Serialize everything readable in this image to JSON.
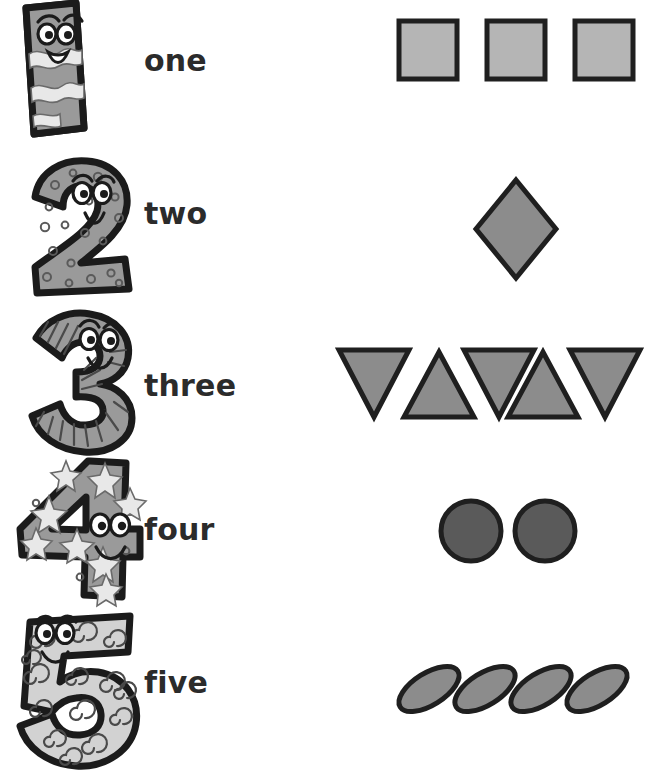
{
  "page": {
    "kind": "counting-worksheet",
    "background_color": "#ffffff",
    "width": 652,
    "height": 781
  },
  "palette": {
    "ink": "#1b1b1b",
    "text": "#2b2b2b",
    "shape_light": "#b5b5b5",
    "shape_medium": "#8c8c8c",
    "shape_dark": "#5a5a5a",
    "numeral_fill_medium": "#9a9a9a",
    "numeral_fill_light": "#d2d2d2",
    "decoration_light": "#e8e8e8"
  },
  "rows": [
    {
      "digit": "1",
      "word": "one",
      "numeral_pattern": "wavy-stripes",
      "numeral_fill": "#9a9a9a",
      "shape_name": "square",
      "shape_count": 3,
      "shape_fill": "#b5b5b5"
    },
    {
      "digit": "2",
      "word": "two",
      "numeral_pattern": "dots",
      "numeral_fill": "#9a9a9a",
      "shape_name": "diamond",
      "shape_count": 1,
      "shape_fill": "#8c8c8c"
    },
    {
      "digit": "3",
      "word": "three",
      "numeral_pattern": "radiating-stripes",
      "numeral_fill": "#9a9a9a",
      "shape_name": "triangle",
      "shape_count": 5,
      "shape_fill": "#8c8c8c"
    },
    {
      "digit": "4",
      "word": "four",
      "numeral_pattern": "stars",
      "numeral_fill": "#9a9a9a",
      "shape_name": "circle",
      "shape_count": 2,
      "shape_fill": "#5a5a5a"
    },
    {
      "digit": "5",
      "word": "five",
      "numeral_pattern": "spirals",
      "numeral_fill": "#d2d2d2",
      "shape_name": "ellipse",
      "shape_count": 4,
      "shape_fill": "#8c8c8c"
    }
  ]
}
